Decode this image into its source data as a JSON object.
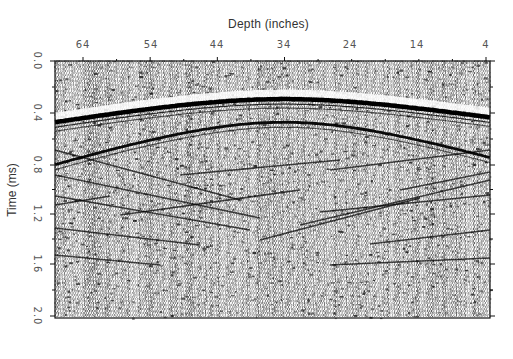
{
  "chart_data": {
    "type": "heatmap",
    "subtype": "seismic-wiggle-radargram",
    "title": "",
    "xlabel": "Depth (inches)",
    "ylabel": "Time (ms)",
    "x_ticks": [
      {
        "label": "64",
        "value": 64,
        "px": 83
      },
      {
        "label": "54",
        "value": 54,
        "px": 151
      },
      {
        "label": "44",
        "value": 44,
        "px": 217
      },
      {
        "label": "34",
        "value": 34,
        "px": 284
      },
      {
        "label": "24",
        "value": 24,
        "px": 350
      },
      {
        "label": "14",
        "value": 14,
        "px": 417
      },
      {
        "label": "4",
        "value": 4,
        "px": 486
      }
    ],
    "y_ticks": [
      {
        "label": "0.0",
        "value": 0.0,
        "px": 61
      },
      {
        "label": "0.4",
        "value": 0.4,
        "px": 113
      },
      {
        "label": "0.8",
        "value": 0.8,
        "px": 165
      },
      {
        "label": "1.2",
        "value": 1.2,
        "px": 214
      },
      {
        "label": "1.6",
        "value": 1.6,
        "px": 264
      },
      {
        "label": "2.0",
        "value": 2.0,
        "px": 316
      }
    ],
    "xlim": [
      68.5,
      3.5
    ],
    "ylim": [
      2.0,
      0.0
    ],
    "x_axis_position": "top",
    "y_axis_inverted": true,
    "grid": false,
    "legend": null,
    "reflectors": [
      {
        "name": "primary hyperbola",
        "apex_depth_in": 34,
        "apex_time_ms": 0.25,
        "edge_time_left_ms": 0.43,
        "edge_time_right_ms": 0.4,
        "strength": "strong"
      },
      {
        "name": "secondary hyperbola",
        "apex_depth_in": 34,
        "apex_time_ms": 0.43,
        "edge_time_left_ms": 0.76,
        "edge_time_right_ms": 0.72,
        "strength": "medium"
      },
      {
        "name": "deeper crossing diffractions",
        "time_range_ms": [
          0.8,
          1.4
        ],
        "strength": "weak"
      }
    ]
  },
  "frame": {
    "left": 55,
    "top": 61,
    "right": 490,
    "bottom": 318
  },
  "colors": {
    "ink": "#111111",
    "paper": "#ffffff",
    "axis": "#333333"
  }
}
